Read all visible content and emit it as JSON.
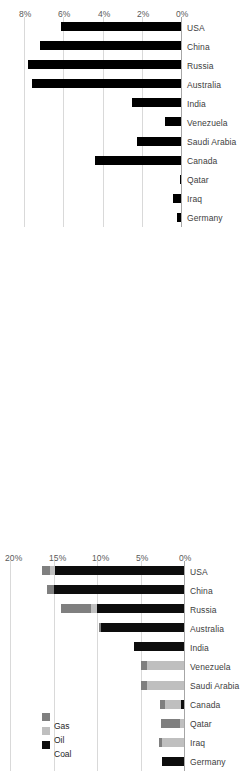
{
  "chart_data": [
    {
      "id": "top",
      "type": "bar",
      "title": "",
      "xlabel": "",
      "ylabel": "",
      "orientation": "rotated-90",
      "grid": true,
      "legend": null,
      "categories": [
        "Germany",
        "Iraq",
        "Qatar",
        "Canada",
        "Saudi Arabia",
        "Venezuela",
        "India",
        "Australia",
        "Russia",
        "China",
        "USA"
      ],
      "values": [
        0.2,
        0.4,
        0.05,
        4.4,
        2.25,
        0.8,
        2.5,
        7.6,
        7.8,
        7.2,
        6.1
      ],
      "ylim": [
        0,
        8
      ],
      "yticks": [
        0,
        2,
        4,
        6,
        8
      ],
      "ytick_labels": [
        "0%",
        "2%",
        "4%",
        "6%",
        "8%"
      ],
      "series_color": "#000000"
    },
    {
      "id": "bottom",
      "type": "bar",
      "subtype": "stacked",
      "title": "",
      "xlabel": "",
      "ylabel": "",
      "orientation": "rotated-90",
      "grid": true,
      "legend": {
        "position": "upper-left",
        "entries": [
          "Coal",
          "Oil",
          "Gas"
        ]
      },
      "categories": [
        "Germany",
        "Iraq",
        "Qatar",
        "Canada",
        "Saudi Arabia",
        "Venezuela",
        "India",
        "Australia",
        "Russia",
        "China",
        "USA"
      ],
      "series": [
        {
          "name": "Coal",
          "color": "#0d0d0d",
          "values": [
            2.5,
            0.0,
            0.0,
            0.4,
            0.0,
            0.0,
            5.8,
            9.5,
            10.0,
            14.9,
            14.8
          ]
        },
        {
          "name": "Oil",
          "color": "#bfbfbf",
          "values": [
            0.0,
            2.5,
            0.5,
            1.8,
            4.3,
            4.3,
            0.0,
            0.0,
            0.7,
            0.0,
            0.6
          ]
        },
        {
          "name": "Gas",
          "color": "#7f7f7f",
          "values": [
            0.0,
            0.4,
            2.2,
            0.6,
            0.6,
            0.6,
            0.0,
            0.3,
            3.4,
            0.8,
            0.9
          ]
        }
      ],
      "totals": [
        2.5,
        2.9,
        2.7,
        2.8,
        4.9,
        4.9,
        5.8,
        9.8,
        14.1,
        15.7,
        16.3
      ],
      "ylim": [
        0,
        20
      ],
      "yticks": [
        0,
        5,
        10,
        15,
        20
      ],
      "ytick_labels": [
        "0%",
        "5%",
        "10%",
        "15%",
        "20%"
      ]
    }
  ]
}
